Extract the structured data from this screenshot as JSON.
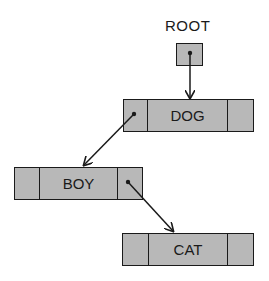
{
  "diagram": {
    "type": "binary-search-tree",
    "root_label": "ROOT",
    "nodes": [
      {
        "id": "dog",
        "value": "DOG"
      },
      {
        "id": "boy",
        "value": "BOY"
      },
      {
        "id": "cat",
        "value": "CAT"
      }
    ],
    "edges": [
      {
        "from": "ROOT",
        "to": "dog",
        "pointer": "root"
      },
      {
        "from": "dog",
        "to": "boy",
        "pointer": "left"
      },
      {
        "from": "boy",
        "to": "cat",
        "pointer": "right"
      }
    ],
    "colors": {
      "fill": "#b8b8b8",
      "stroke": "#1a1a1a"
    }
  }
}
